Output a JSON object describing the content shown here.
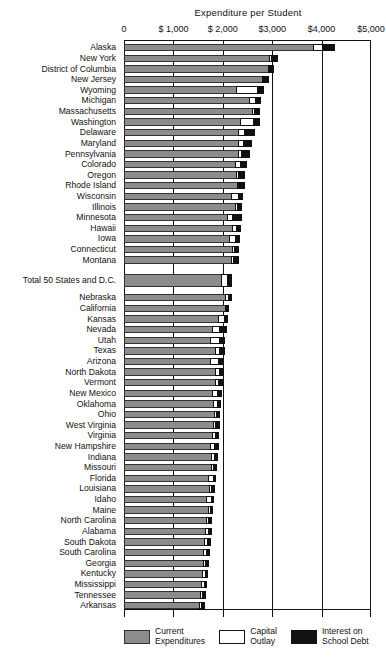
{
  "chart_data": {
    "type": "bar",
    "orientation": "horizontal",
    "stacked": true,
    "title": "Expenditure per Student",
    "xlabel": "",
    "ylabel": "",
    "xlim": [
      0,
      5000
    ],
    "grid": true,
    "legend_position": "bottom",
    "tick_labels": [
      "0",
      "$ 1,000",
      "$ 2,000",
      "$3,000",
      "$4,000",
      "$5,000"
    ],
    "tick_values": [
      0,
      1000,
      2000,
      3000,
      4000,
      5000
    ],
    "series": [
      {
        "name": "Current Expenditures",
        "color": "#8c8c8c"
      },
      {
        "name": "Capital Outlay",
        "color": "#ffffff"
      },
      {
        "name": "Interest on School Debt",
        "color": "#111111"
      }
    ],
    "categories": [
      "Alaska",
      "New York",
      "District of Columbia",
      "New Jersey",
      "Wyoming",
      "Michigan",
      "Massachusetts",
      "Washington",
      "Delaware",
      "Maryland",
      "Pennsylvania",
      "Colorado",
      "Oregon",
      "Rhode Island",
      "Wisconsin",
      "Illinois",
      "Minnesota",
      "Hawaii",
      "Iowa",
      "Connecticut",
      "Montana",
      "Total 50 States and D.C.",
      "Nebraska",
      "California",
      "Kansas",
      "Nevada",
      "Utah",
      "Texas",
      "Arizona",
      "North Dakota",
      "Vermont",
      "New Mexico",
      "Oklahoma",
      "Ohio",
      "West Virginia",
      "Virginia",
      "New Hampshire",
      "Indiana",
      "Missouri",
      "Florida",
      "Louisiana",
      "Idaho",
      "Maine",
      "North Carolina",
      "Alabama",
      "South Dakota",
      "South Carolina",
      "Georgia",
      "Kentucky",
      "Mississippi",
      "Tennessee",
      "Arkansas"
    ],
    "rows": [
      {
        "label": "Alaska",
        "current": 3820,
        "capital": 205,
        "interest": 250,
        "total": 4275,
        "group": "state"
      },
      {
        "label": "New York",
        "current": 2945,
        "capital": 55,
        "interest": 125,
        "total": 3125,
        "group": "state"
      },
      {
        "label": "District of Columbia",
        "current": 2905,
        "capital": 20,
        "interest": 90,
        "total": 3015,
        "group": "state"
      },
      {
        "label": "New Jersey",
        "current": 2790,
        "capital": 25,
        "interest": 115,
        "total": 2930,
        "group": "state"
      },
      {
        "label": "Wyoming",
        "current": 2270,
        "capital": 450,
        "interest": 120,
        "total": 2840,
        "group": "state"
      },
      {
        "label": "Michigan",
        "current": 2535,
        "capital": 135,
        "interest": 110,
        "total": 2780,
        "group": "state"
      },
      {
        "label": "Massachusetts",
        "current": 2600,
        "capital": 45,
        "interest": 115,
        "total": 2760,
        "group": "state"
      },
      {
        "label": "Washington",
        "current": 2345,
        "capital": 290,
        "interest": 110,
        "total": 2745,
        "group": "state"
      },
      {
        "label": "Delaware",
        "current": 2300,
        "capital": 155,
        "interest": 200,
        "total": 2655,
        "group": "state"
      },
      {
        "label": "Maryland",
        "current": 2310,
        "capital": 115,
        "interest": 175,
        "total": 2600,
        "group": "state"
      },
      {
        "label": "Pennsylvania",
        "current": 2300,
        "capital": 95,
        "interest": 155,
        "total": 2550,
        "group": "state"
      },
      {
        "label": "Colorado",
        "current": 2245,
        "capital": 130,
        "interest": 110,
        "total": 2485,
        "group": "state"
      },
      {
        "label": "Oregon",
        "current": 2265,
        "capital": 70,
        "interest": 120,
        "total": 2455,
        "group": "state"
      },
      {
        "label": "Rhode Island",
        "current": 2295,
        "capital": 35,
        "interest": 105,
        "total": 2435,
        "group": "state"
      },
      {
        "label": "Wisconsin",
        "current": 2160,
        "capital": 170,
        "interest": 85,
        "total": 2415,
        "group": "state"
      },
      {
        "label": "Illinois",
        "current": 2255,
        "capital": 60,
        "interest": 80,
        "total": 2395,
        "group": "state"
      },
      {
        "label": "Minnesota",
        "current": 2090,
        "capital": 110,
        "interest": 180,
        "total": 2380,
        "group": "state"
      },
      {
        "label": "Hawaii",
        "current": 2195,
        "capital": 95,
        "interest": 75,
        "total": 2365,
        "group": "state"
      },
      {
        "label": "Iowa",
        "current": 2130,
        "capital": 135,
        "interest": 85,
        "total": 2350,
        "group": "state"
      },
      {
        "label": "Connecticut",
        "current": 2190,
        "capital": 60,
        "interest": 85,
        "total": 2335,
        "group": "state"
      },
      {
        "label": "Montana",
        "current": 2160,
        "capital": 75,
        "interest": 85,
        "total": 2320,
        "group": "state"
      },
      {
        "label": "Total 50 States and D.C.",
        "current": 1965,
        "capital": 145,
        "interest": 70,
        "total": 2180,
        "group": "total"
      },
      {
        "label": "Nebraska",
        "current": 2040,
        "capital": 80,
        "interest": 60,
        "total": 2180,
        "group": "state"
      },
      {
        "label": "California",
        "current": 2035,
        "capital": 40,
        "interest": 55,
        "total": 2130,
        "group": "state"
      },
      {
        "label": "Kansas",
        "current": 1900,
        "capital": 135,
        "interest": 70,
        "total": 2105,
        "group": "state"
      },
      {
        "label": "Nevada",
        "current": 1775,
        "capital": 165,
        "interest": 150,
        "total": 2090,
        "group": "state"
      },
      {
        "label": "Utah",
        "current": 1745,
        "capital": 190,
        "interest": 120,
        "total": 2055,
        "group": "state"
      },
      {
        "label": "Texas",
        "current": 1835,
        "capital": 115,
        "interest": 95,
        "total": 2045,
        "group": "state"
      },
      {
        "label": "Arizona",
        "current": 1750,
        "capital": 165,
        "interest": 110,
        "total": 2025,
        "group": "state"
      },
      {
        "label": "North Dakota",
        "current": 1840,
        "capital": 110,
        "interest": 60,
        "total": 2010,
        "group": "state"
      },
      {
        "label": "Vermont",
        "current": 1845,
        "capital": 75,
        "interest": 75,
        "total": 1995,
        "group": "state"
      },
      {
        "label": "New Mexico",
        "current": 1780,
        "capital": 125,
        "interest": 75,
        "total": 1980,
        "group": "state"
      },
      {
        "label": "Oklahoma",
        "current": 1800,
        "capital": 95,
        "interest": 65,
        "total": 1960,
        "group": "state"
      },
      {
        "label": "Ohio",
        "current": 1825,
        "capital": 55,
        "interest": 70,
        "total": 1950,
        "group": "state"
      },
      {
        "label": "West Virginia",
        "current": 1800,
        "capital": 70,
        "interest": 70,
        "total": 1940,
        "group": "state"
      },
      {
        "label": "Virginia",
        "current": 1775,
        "capital": 85,
        "interest": 65,
        "total": 1925,
        "group": "state"
      },
      {
        "label": "New Hampshire",
        "current": 1740,
        "capital": 95,
        "interest": 80,
        "total": 1915,
        "group": "state"
      },
      {
        "label": "Indiana",
        "current": 1755,
        "capital": 90,
        "interest": 55,
        "total": 1900,
        "group": "state"
      },
      {
        "label": "Missouri",
        "current": 1770,
        "capital": 60,
        "interest": 55,
        "total": 1885,
        "group": "state"
      },
      {
        "label": "Florida",
        "current": 1700,
        "capital": 115,
        "interest": 50,
        "total": 1865,
        "group": "state"
      },
      {
        "label": "Louisiana",
        "current": 1715,
        "capital": 75,
        "interest": 55,
        "total": 1845,
        "group": "state"
      },
      {
        "label": "Idaho",
        "current": 1665,
        "capital": 110,
        "interest": 55,
        "total": 1830,
        "group": "state"
      },
      {
        "label": "Maine",
        "current": 1700,
        "capital": 55,
        "interest": 55,
        "total": 1810,
        "group": "state"
      },
      {
        "label": "North Carolina",
        "current": 1650,
        "capital": 65,
        "interest": 75,
        "total": 1790,
        "group": "state"
      },
      {
        "label": "Alabama",
        "current": 1640,
        "capital": 85,
        "interest": 50,
        "total": 1775,
        "group": "state"
      },
      {
        "label": "South Dakota",
        "current": 1625,
        "capital": 75,
        "interest": 60,
        "total": 1760,
        "group": "state"
      },
      {
        "label": "South Carolina",
        "current": 1595,
        "capital": 90,
        "interest": 55,
        "total": 1740,
        "group": "state"
      },
      {
        "label": "Georgia",
        "current": 1590,
        "capital": 70,
        "interest": 60,
        "total": 1720,
        "group": "state"
      },
      {
        "label": "Kentucky",
        "current": 1585,
        "capital": 65,
        "interest": 50,
        "total": 1700,
        "group": "state"
      },
      {
        "label": "Mississippi",
        "current": 1560,
        "capital": 70,
        "interest": 45,
        "total": 1675,
        "group": "state"
      },
      {
        "label": "Tennessee",
        "current": 1545,
        "capital": 60,
        "interest": 50,
        "total": 1655,
        "group": "state"
      },
      {
        "label": "Arkansas",
        "current": 1520,
        "capital": 65,
        "interest": 45,
        "total": 1630,
        "group": "state"
      }
    ]
  },
  "legend": {
    "items": [
      {
        "label": "Current\nExpenditures",
        "swatch": "cur"
      },
      {
        "label": "Capital\nOutlay",
        "swatch": "cap"
      },
      {
        "label": "Interest on\nSchool Debt",
        "swatch": "int"
      }
    ]
  }
}
